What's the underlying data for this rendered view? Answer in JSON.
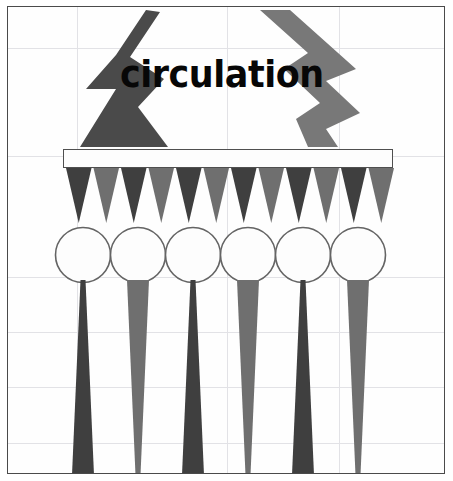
{
  "canvas": {
    "width": 453,
    "height": 481,
    "background": "#ffffff",
    "frame_color": "#4a4a4a",
    "grid_color": "#e2e2e6"
  },
  "wordmark": {
    "text": "circulation",
    "color": "#070707"
  },
  "palette": {
    "dark_gray": "#3f3f3f",
    "mid_gray": "#6f6f6f",
    "light_gray": "#7a7a7a",
    "outline": "#555555",
    "white": "#fdfdfd"
  },
  "grid": {
    "vertical_x": [
      69,
      219,
      331
    ],
    "horizontal_y": [
      41,
      149,
      270,
      325,
      380,
      436
    ]
  },
  "chart_data": {
    "type": "diagram",
    "title": "circulation",
    "elements": [
      {
        "name": "zigzag-left",
        "kind": "lightning-bolt",
        "fill": "#4a4a4a",
        "points": "138,3 108,48 78,82 108,82 72,140 160,140 130,100 156,72 122,50 152,5"
      },
      {
        "name": "zigzag-right",
        "kind": "lightning-bolt",
        "fill": "#787878",
        "points": "282,3 348,62 318,74 352,106 318,122 330,140 300,140 288,112 312,96 276,62 300,46 252,3"
      },
      {
        "name": "plate",
        "kind": "rectangle",
        "fill": "#fdfdfd",
        "stroke": "#4f4f4f",
        "x": 55,
        "y": 142,
        "width": 330,
        "height": 19
      }
    ],
    "triangle_row": {
      "count": 12,
      "top": 161,
      "bottom": 216,
      "colors": [
        "#3f3f3f",
        "#6f6f6f"
      ],
      "note": "alternating dark/mid gray downward triangles"
    },
    "circle_row": {
      "count": 6,
      "diameter": 55,
      "center_y": 248,
      "first_center_x": 82,
      "spacing": 55,
      "fill": "#fdfdfd",
      "stroke": "#646464"
    },
    "spike_row": {
      "count": 6,
      "top": 273,
      "bottom": 468,
      "directions": [
        "up",
        "down",
        "up",
        "down",
        "up",
        "down"
      ],
      "colors": [
        "#3f3f3f",
        "#6f6f6f",
        "#3f3f3f",
        "#6f6f6f",
        "#3f3f3f",
        "#6f6f6f"
      ],
      "note": "dark spikes taper upward (apex top), gray spikes taper downward (apex bottom)"
    }
  }
}
